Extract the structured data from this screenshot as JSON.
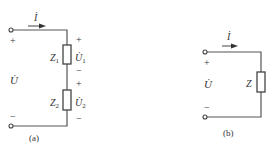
{
  "circuit_a": {
    "caption": "(a)",
    "current_label": "İ",
    "source_voltage": "U̇",
    "top_terminal_sign": "+",
    "bottom_terminal_sign": "−",
    "elements": [
      {
        "name": "Z",
        "sub": "1",
        "voltage": "U̇",
        "voltage_sub": "1",
        "plus": "+",
        "minus": "−"
      },
      {
        "name": "Z",
        "sub": "2",
        "voltage": "U̇",
        "voltage_sub": "2",
        "plus": "+",
        "minus": "−"
      }
    ]
  },
  "circuit_b": {
    "caption": "(b)",
    "current_label": "İ",
    "source_voltage": "U̇",
    "top_terminal_sign": "+",
    "bottom_terminal_sign": "−",
    "element": {
      "name": "Z"
    }
  }
}
